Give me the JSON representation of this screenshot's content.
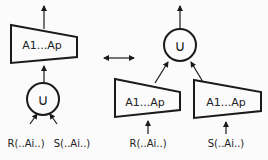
{
  "diagram": {
    "colors": {
      "stroke": "#1a1a1a",
      "background": "#fbfbfb"
    },
    "left": {
      "projection_label": "A1...Ap",
      "union_symbol": "∪",
      "inputs": [
        "R(..Ai..)",
        "S(..Ai..)"
      ]
    },
    "equivalence_arrow": "double-headed-arrow",
    "right": {
      "union_symbol": "∪",
      "projection_left_label": "A1...Ap",
      "projection_right_label": "A1...Ap",
      "inputs": [
        "R(..Ai..)",
        "S(..Ai..)"
      ]
    }
  }
}
